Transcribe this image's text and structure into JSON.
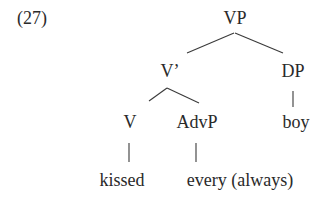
{
  "example": {
    "number": "(27)"
  },
  "tree": {
    "nodes": {
      "vp": "VP",
      "vbar": "V’",
      "dp": "DP",
      "v": "V",
      "advp": "AdvP",
      "boy": "boy",
      "kissed": "kissed",
      "every": "every (always)"
    },
    "edges": [
      [
        "VP",
        "V’"
      ],
      [
        "VP",
        "DP"
      ],
      [
        "V’",
        "V"
      ],
      [
        "V’",
        "AdvP"
      ],
      [
        "DP",
        "boy"
      ],
      [
        "V",
        "kissed"
      ],
      [
        "AdvP",
        "every (always)"
      ]
    ]
  }
}
